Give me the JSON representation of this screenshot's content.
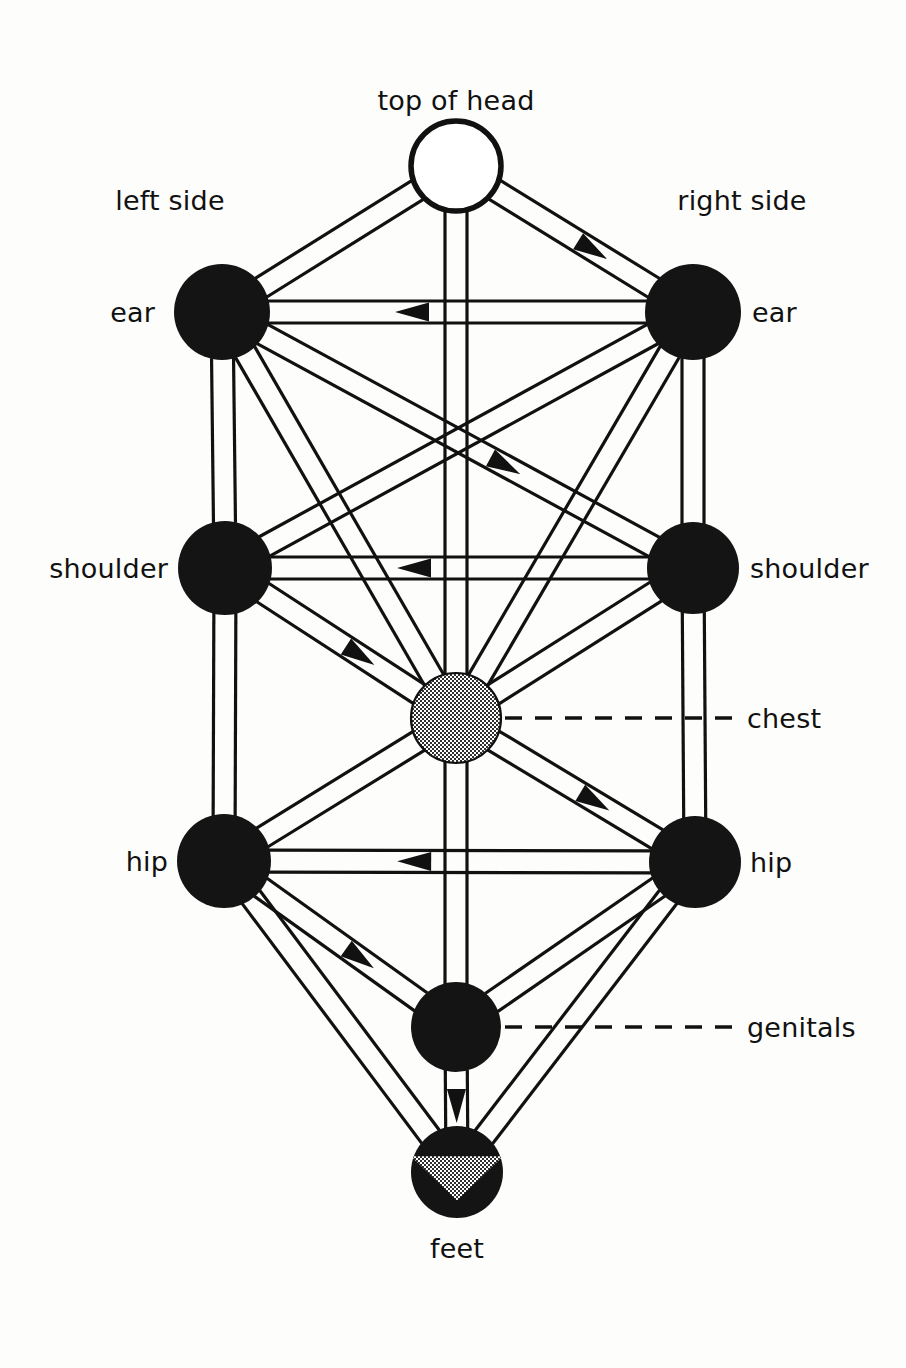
{
  "diagram": {
    "background_color": "#fdfdfb",
    "line_color": "#111111",
    "node_fill_black": "#141414",
    "node_fill_gray": "#8a8a8a",
    "node_fill_white": "#ffffff",
    "side_labels": {
      "left": "left side",
      "right": "right side"
    },
    "nodes": [
      {
        "id": "head",
        "label": "top of head",
        "x": 456,
        "y": 166,
        "r": 45,
        "fill": "white",
        "label_pos": "above",
        "label_x": 456,
        "label_y": 110
      },
      {
        "id": "ear_l",
        "label": "ear",
        "x": 222,
        "y": 312,
        "r": 48,
        "fill": "black",
        "label_pos": "left",
        "label_x": 155,
        "label_y": 322
      },
      {
        "id": "ear_r",
        "label": "ear",
        "x": 693,
        "y": 312,
        "r": 48,
        "fill": "black",
        "label_pos": "right",
        "label_x": 752,
        "label_y": 322
      },
      {
        "id": "shoulder_l",
        "label": "shoulder",
        "x": 225,
        "y": 568,
        "r": 47,
        "fill": "black",
        "label_pos": "left",
        "label_x": 168,
        "label_y": 578
      },
      {
        "id": "shoulder_r",
        "label": "shoulder",
        "x": 693,
        "y": 568,
        "r": 46,
        "fill": "black",
        "label_pos": "right",
        "label_x": 750,
        "label_y": 578
      },
      {
        "id": "chest",
        "label": "chest",
        "x": 456,
        "y": 718,
        "r": 45,
        "fill": "gray",
        "label_pos": "leader-right",
        "label_x": 747,
        "label_y": 728
      },
      {
        "id": "hip_l",
        "label": "hip",
        "x": 224,
        "y": 861,
        "r": 47,
        "fill": "black",
        "label_pos": "left",
        "label_x": 168,
        "label_y": 871
      },
      {
        "id": "hip_r",
        "label": "hip",
        "x": 695,
        "y": 862,
        "r": 46,
        "fill": "black",
        "label_pos": "right",
        "label_x": 750,
        "label_y": 872
      },
      {
        "id": "genitals",
        "label": "genitals",
        "x": 456,
        "y": 1027,
        "r": 45,
        "fill": "black",
        "label_pos": "leader-right",
        "label_x": 747,
        "label_y": 1037
      },
      {
        "id": "feet",
        "label": "feet",
        "x": 457,
        "y": 1172,
        "r": 46,
        "fill": "black-gray-wedge",
        "label_pos": "below",
        "label_x": 457,
        "label_y": 1258
      }
    ],
    "leader_lines": [
      {
        "from_node": "chest",
        "to_label": "chest",
        "x1": 505,
        "y1": 718,
        "x2": 735,
        "y2": 718
      },
      {
        "from_node": "genitals",
        "to_label": "genitals",
        "x1": 505,
        "y1": 1027,
        "x2": 735,
        "y2": 1027
      }
    ],
    "edges": [
      {
        "from": "head",
        "to": "ear_l",
        "arrow": "none"
      },
      {
        "from": "head",
        "to": "ear_r",
        "arrow": "forward"
      },
      {
        "from": "head",
        "to": "chest",
        "arrow": "none"
      },
      {
        "from": "ear_r",
        "to": "ear_l",
        "arrow": "forward"
      },
      {
        "from": "ear_l",
        "to": "shoulder_l",
        "arrow": "none"
      },
      {
        "from": "ear_r",
        "to": "shoulder_r",
        "arrow": "none"
      },
      {
        "from": "ear_l",
        "to": "shoulder_r",
        "arrow": "forward"
      },
      {
        "from": "ear_r",
        "to": "shoulder_l",
        "arrow": "none"
      },
      {
        "from": "ear_l",
        "to": "chest",
        "arrow": "none"
      },
      {
        "from": "ear_r",
        "to": "chest",
        "arrow": "none"
      },
      {
        "from": "shoulder_r",
        "to": "shoulder_l",
        "arrow": "forward"
      },
      {
        "from": "shoulder_l",
        "to": "chest",
        "arrow": "forward"
      },
      {
        "from": "shoulder_r",
        "to": "chest",
        "arrow": "none"
      },
      {
        "from": "shoulder_l",
        "to": "hip_l",
        "arrow": "none"
      },
      {
        "from": "shoulder_r",
        "to": "hip_r",
        "arrow": "none"
      },
      {
        "from": "chest",
        "to": "hip_r",
        "arrow": "forward"
      },
      {
        "from": "chest",
        "to": "hip_l",
        "arrow": "none"
      },
      {
        "from": "chest",
        "to": "genitals",
        "arrow": "none"
      },
      {
        "from": "hip_r",
        "to": "hip_l",
        "arrow": "forward"
      },
      {
        "from": "hip_l",
        "to": "genitals",
        "arrow": "forward"
      },
      {
        "from": "hip_r",
        "to": "genitals",
        "arrow": "none"
      },
      {
        "from": "hip_l",
        "to": "feet",
        "arrow": "none"
      },
      {
        "from": "hip_r",
        "to": "feet",
        "arrow": "none"
      },
      {
        "from": "genitals",
        "to": "feet",
        "arrow": "forward"
      }
    ]
  }
}
